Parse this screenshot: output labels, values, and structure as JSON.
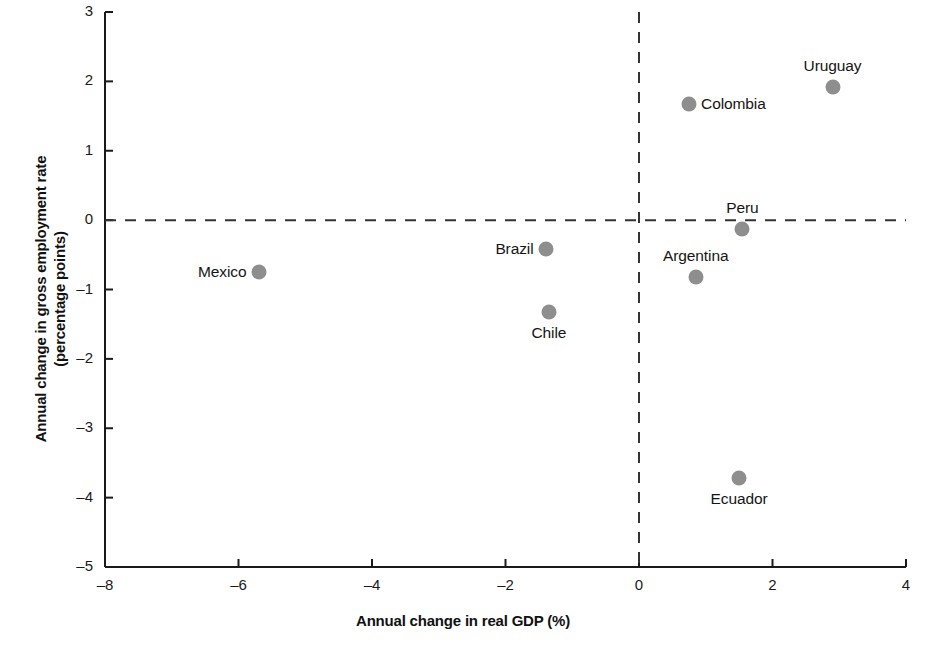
{
  "chart_data": {
    "type": "scatter",
    "title": "",
    "xlabel": "Annual change in real GDP (%)",
    "ylabel": "Annual change in gross employment rate\n(percentage points)",
    "ylabel_line1": "Annual change in gross employment rate",
    "ylabel_line2": "(percentage points)",
    "xlim": [
      -8,
      4
    ],
    "ylim": [
      -5,
      3
    ],
    "xticks": [
      -8,
      -6,
      -4,
      -2,
      0,
      2,
      4
    ],
    "xticklabels": [
      "–8",
      "–6",
      "–4",
      "–2",
      "0",
      "2",
      "4"
    ],
    "yticks": [
      -5,
      -4,
      -3,
      -2,
      -1,
      0,
      1,
      2,
      3
    ],
    "yticklabels": [
      "–5",
      "–4",
      "–3",
      "–2",
      "–1",
      "0",
      "1",
      "2",
      "3"
    ],
    "grid": false,
    "legend": null,
    "reference_lines": [
      {
        "name": "zero-horizontal",
        "axis": "y",
        "value": 0,
        "style": "dashed"
      },
      {
        "name": "zero-vertical",
        "axis": "x",
        "value": 0,
        "style": "dashed"
      }
    ],
    "marker_color": "#8e8e8e",
    "axis_color": "#1a1a1a",
    "points": [
      {
        "label": "Mexico",
        "x": -5.7,
        "y": -0.75,
        "label_pos": "left"
      },
      {
        "label": "Brazil",
        "x": -1.4,
        "y": -0.42,
        "label_pos": "left"
      },
      {
        "label": "Chile",
        "x": -1.35,
        "y": -1.32,
        "label_pos": "below"
      },
      {
        "label": "Colombia",
        "x": 0.75,
        "y": 1.68,
        "label_pos": "right"
      },
      {
        "label": "Argentina",
        "x": 0.85,
        "y": -0.82,
        "label_pos": "above"
      },
      {
        "label": "Ecuador",
        "x": 1.5,
        "y": -3.72,
        "label_pos": "below"
      },
      {
        "label": "Peru",
        "x": 1.55,
        "y": -0.13,
        "label_pos": "above"
      },
      {
        "label": "Uruguay",
        "x": 2.9,
        "y": 1.92,
        "label_pos": "above"
      }
    ]
  }
}
